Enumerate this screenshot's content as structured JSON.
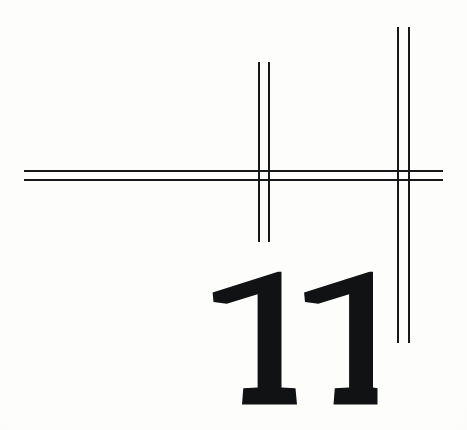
{
  "page": {
    "kind": "book-chapter-opener-scan",
    "width": 467,
    "height": 430,
    "background_color": "#fdfdfb",
    "ink_color": "#17181a"
  },
  "chapter": {
    "number": "11",
    "numeral_style": "bold-serif",
    "numeral_color": "#111214"
  },
  "rules": {
    "horizontal": {
      "label": "horizontal double rule",
      "count": 2,
      "color": "#17181a",
      "thickness_px": 2,
      "x_start": 24,
      "x_end": 443,
      "y_positions": [
        170,
        179
      ]
    },
    "vertical_left": {
      "label": "left vertical double rule",
      "count": 2,
      "color": "#17181a",
      "thickness_px": 2,
      "x_positions": [
        258,
        268
      ],
      "y_start": 62,
      "y_end": 242
    },
    "vertical_right": {
      "label": "right vertical double rule",
      "count": 2,
      "color": "#17181a",
      "thickness_px": 2,
      "x_positions": [
        397,
        408
      ],
      "y_start": 27,
      "y_end": 343
    }
  }
}
